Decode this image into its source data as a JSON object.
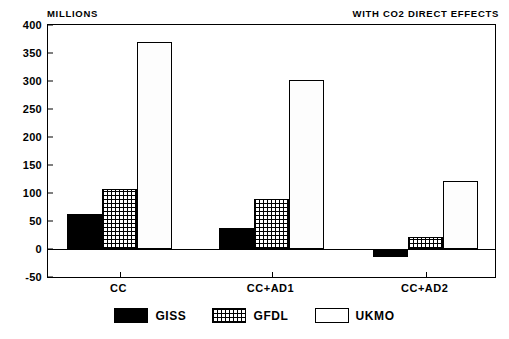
{
  "header": {
    "units_label": "MILLIONS",
    "title_right": "WITH CO2 DIRECT EFFECTS",
    "annotation": "BASE  1990 · 529; 2060 · 641"
  },
  "axes": {
    "y_ticks": [
      400,
      350,
      300,
      250,
      200,
      150,
      100,
      50,
      0,
      -50
    ],
    "y_min": -50,
    "y_max": 400,
    "x_categories": [
      "CC",
      "CC+AD1",
      "CC+AD2"
    ]
  },
  "legend": {
    "items": [
      {
        "label": "GISS",
        "swatch": "solid-black",
        "color": "#000000"
      },
      {
        "label": "GFDL",
        "swatch": "cross-hatch",
        "color": "#000000"
      },
      {
        "label": "UKMO",
        "swatch": "white-outline",
        "color": "#ffffff"
      }
    ]
  },
  "chart_data": {
    "type": "bar",
    "title": "WITH CO2 DIRECT EFFECTS",
    "subtitle": "BASE  1990 · 529; 2060 · 641",
    "xlabel": "",
    "ylabel": "MILLIONS",
    "categories": [
      "CC",
      "CC+AD1",
      "CC+AD2"
    ],
    "series": [
      {
        "name": "GISS",
        "values": [
          63,
          38,
          -15
        ]
      },
      {
        "name": "GFDL",
        "values": [
          107,
          89,
          22
        ]
      },
      {
        "name": "UKMO",
        "values": [
          370,
          302,
          122
        ]
      }
    ],
    "ylim": [
      -50,
      400
    ],
    "ytick_step": 50,
    "grid": false,
    "legend_position": "bottom-center"
  }
}
